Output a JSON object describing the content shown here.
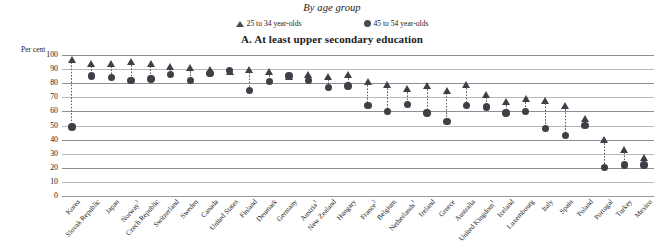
{
  "header": {
    "subtitle": "By age group",
    "panel_title": "A.  At least upper secondary education",
    "unit_label": "Per cent"
  },
  "legend": {
    "items": [
      {
        "marker": "triangle-marker",
        "label": "25 to 34 year-olds",
        "color": "#3f3f48"
      },
      {
        "marker": "circle-marker",
        "label": "45 to 54 year-olds",
        "color": "#3f3f48"
      }
    ]
  },
  "axis": {
    "y_ticks": [
      "100",
      "90",
      "80",
      "70",
      "60",
      "50",
      "40",
      "30",
      "20",
      "10",
      "0"
    ],
    "y_min": 0,
    "y_max": 100,
    "y_step": 10
  },
  "chart_data": {
    "type": "scatter",
    "title": "A.  At least upper secondary education",
    "subtitle": "By age group",
    "xlabel": "",
    "ylabel": "Per cent",
    "ylim": [
      0,
      100
    ],
    "grid": true,
    "legend_position": "top-center",
    "categories": [
      "Korea",
      "Slovak Republic",
      "Japan",
      "Norway¹",
      "Czech Republic",
      "Switzerland",
      "Sweden",
      "Canada",
      "United States",
      "Finland",
      "Denmark",
      "Germany",
      "Austria¹",
      "New Zealand",
      "Hungary",
      "France²",
      "Belgium",
      "Netherlands¹",
      "Ireland",
      "Greece",
      "Australia",
      "United Kingdom¹",
      "Iceland",
      "Luxembourg",
      "Italy",
      "Spain",
      "Poland",
      "Portugal",
      "Turkey",
      "Mexico"
    ],
    "category_notes": {
      "Norway¹": "1",
      "Austria¹": "1",
      "France²": "2",
      "Netherlands¹": "1",
      "United Kingdom¹": "1"
    },
    "series": [
      {
        "name": "25 to 34 year-olds",
        "marker": "triangle",
        "color": "#3f3f48",
        "values": [
          97,
          94,
          94,
          95,
          94,
          92,
          91,
          90,
          88,
          90,
          88,
          85,
          86,
          85,
          86,
          81,
          79,
          76,
          78,
          75,
          79,
          72,
          67,
          69,
          68,
          64,
          55,
          40,
          33,
          27
        ]
      },
      {
        "name": "45 to 54 year-olds",
        "marker": "circle",
        "color": "#3f3f48",
        "values": [
          49,
          85,
          84,
          82,
          83,
          86,
          82,
          87,
          89,
          75,
          81,
          85,
          82,
          77,
          78,
          64,
          60,
          65,
          59,
          53,
          64,
          63,
          59,
          60,
          48,
          43,
          50,
          20,
          22,
          22
        ]
      }
    ]
  }
}
